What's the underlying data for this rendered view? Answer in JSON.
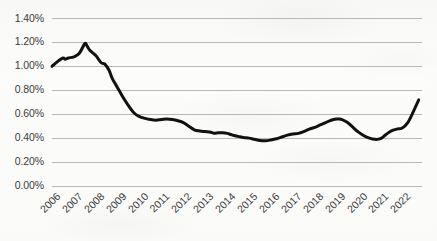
{
  "chart_data": {
    "type": "line",
    "title": "",
    "subtitle": "",
    "xlabel": "",
    "ylabel": "",
    "legend": [],
    "legend_position": "none",
    "grid": true,
    "grid_axis": "y",
    "line_color": "#111111",
    "line_width_px": 3,
    "background_color": "#fcfcfb",
    "gridline_color": "#b8b8b8",
    "axis_text_color": "#3b3b3b",
    "xlim": [
      2006,
      2022.9
    ],
    "ylim": [
      0.0,
      1.4
    ],
    "y_tick_labels": [
      "0.00%",
      "0.20%",
      "0.40%",
      "0.60%",
      "0.80%",
      "1.00%",
      "1.20%",
      "1.40%"
    ],
    "y_tick_values": [
      0.0,
      0.2,
      0.4,
      0.6,
      0.8,
      1.0,
      1.2,
      1.4
    ],
    "x_tick_labels": [
      "2006",
      "2007",
      "2008",
      "2009",
      "2010",
      "2011",
      "2012",
      "2013",
      "2014",
      "2015",
      "2016",
      "2017",
      "2018",
      "2019",
      "2020",
      "2021",
      "2022"
    ],
    "x_tick_values": [
      2006,
      2007,
      2008,
      2009,
      2010,
      2011,
      2012,
      2013,
      2014,
      2015,
      2016,
      2017,
      2018,
      2019,
      2020,
      2021,
      2022
    ],
    "x_tick_rotation_deg": -45,
    "value_unit": "percent",
    "series": [
      {
        "name": "series-1",
        "color": "#111111",
        "x": [
          2006.0,
          2006.25,
          2006.5,
          2006.6,
          2006.75,
          2007.0,
          2007.25,
          2007.5,
          2007.6,
          2007.75,
          2008.0,
          2008.25,
          2008.4,
          2008.6,
          2008.75,
          2009.0,
          2009.25,
          2009.5,
          2009.75,
          2010.0,
          2010.25,
          2010.5,
          2010.75,
          2011.0,
          2011.25,
          2011.5,
          2011.75,
          2012.0,
          2012.25,
          2012.5,
          2012.75,
          2013.0,
          2013.25,
          2013.4,
          2013.6,
          2013.8,
          2014.0,
          2014.25,
          2014.5,
          2014.75,
          2015.0,
          2015.25,
          2015.5,
          2015.75,
          2016.0,
          2016.25,
          2016.5,
          2016.75,
          2017.0,
          2017.25,
          2017.5,
          2017.75,
          2018.0,
          2018.25,
          2018.5,
          2018.75,
          2019.0,
          2019.1,
          2019.25,
          2019.5,
          2019.75,
          2020.0,
          2020.25,
          2020.5,
          2020.75,
          2021.0,
          2021.25,
          2021.5,
          2021.75,
          2022.0,
          2022.25,
          2022.5,
          2022.75
        ],
        "values": [
          1.0,
          1.04,
          1.07,
          1.06,
          1.07,
          1.08,
          1.11,
          1.19,
          1.17,
          1.13,
          1.09,
          1.03,
          1.02,
          0.97,
          0.9,
          0.82,
          0.74,
          0.67,
          0.61,
          0.58,
          0.565,
          0.555,
          0.55,
          0.555,
          0.56,
          0.555,
          0.545,
          0.53,
          0.5,
          0.47,
          0.46,
          0.455,
          0.45,
          0.44,
          0.445,
          0.445,
          0.44,
          0.425,
          0.415,
          0.405,
          0.4,
          0.39,
          0.38,
          0.378,
          0.385,
          0.395,
          0.41,
          0.425,
          0.435,
          0.44,
          0.455,
          0.475,
          0.49,
          0.51,
          0.53,
          0.55,
          0.56,
          0.56,
          0.555,
          0.53,
          0.49,
          0.45,
          0.42,
          0.4,
          0.39,
          0.395,
          0.43,
          0.46,
          0.475,
          0.485,
          0.53,
          0.62,
          0.72
        ]
      }
    ],
    "annotations": [],
    "key_points": {
      "start_2006": 1.0,
      "peak": {
        "x": 2007.5,
        "y": 1.19
      },
      "post_crisis_level_2010": 0.58,
      "trough": {
        "x": 2015.6,
        "y": 0.378
      },
      "local_peak_2019": 0.56,
      "covid_dip": {
        "x": 2020.9,
        "y": 0.39
      },
      "end_2022": 0.72
    }
  }
}
